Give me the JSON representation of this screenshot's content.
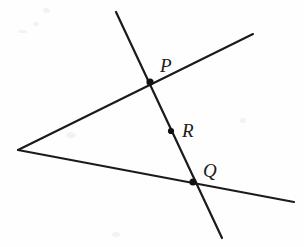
{
  "diagram": {
    "background_color": "#fefefe",
    "stroke_color": "#1a1a1a",
    "labels": {
      "p": "P",
      "q": "Q",
      "r": "R"
    },
    "points": [
      {
        "name": "vertex",
        "label": "",
        "x": 18,
        "y": 150,
        "marked": false
      },
      {
        "name": "P",
        "label": "P",
        "x": 150,
        "y": 82,
        "marked": true,
        "label_x": 160,
        "label_y": 72
      },
      {
        "name": "R",
        "label": "R",
        "x": 171,
        "y": 131,
        "marked": true,
        "label_x": 182,
        "label_y": 137
      },
      {
        "name": "Q",
        "label": "Q",
        "x": 193,
        "y": 182,
        "marked": true,
        "label_x": 203,
        "label_y": 177
      }
    ],
    "lines": [
      {
        "name": "upper-ray",
        "x1": 18,
        "y1": 150,
        "x2": 253,
        "y2": 34
      },
      {
        "name": "lower-ray",
        "x1": 18,
        "y1": 150,
        "x2": 294,
        "y2": 202
      },
      {
        "name": "transversal",
        "x1": 116,
        "y1": 12,
        "x2": 222,
        "y2": 238
      }
    ]
  }
}
